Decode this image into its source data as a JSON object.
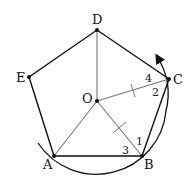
{
  "diagram": {
    "type": "geometry",
    "vertices": [
      "A",
      "B",
      "C",
      "D",
      "E"
    ],
    "center": "O",
    "angle_labels": [
      "1",
      "2",
      "3",
      "4"
    ],
    "colors": {
      "stroke": "#111111",
      "radius_stroke": "#777777"
    }
  }
}
